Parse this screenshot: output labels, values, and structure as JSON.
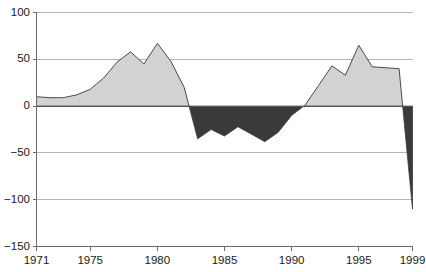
{
  "chart_data": {
    "type": "area",
    "title": "",
    "xlabel": "",
    "ylabel": "",
    "xlim": [
      1971,
      1999
    ],
    "ylim": [
      -150,
      100
    ],
    "grid": true,
    "legend": "none",
    "y_ticks": [
      100,
      50,
      0,
      -50,
      -100,
      -150
    ],
    "y_tick_labels": [
      "100",
      "50",
      "0",
      "−50",
      "−100",
      "−150"
    ],
    "x_ticks": [
      1971,
      1975,
      1980,
      1985,
      1990,
      1995,
      1999
    ],
    "x_tick_labels": [
      "1971",
      "1975",
      "1980",
      "1985",
      "1990",
      "1995",
      "1999"
    ],
    "positive_fill": "#d2d2d2",
    "negative_fill": "#3a3a3a",
    "line_color": "#4a4a4a",
    "grid_color": "#b4b4b4",
    "axis_color": "#6b6b6b",
    "zero_line_color": "#555555",
    "x": [
      1971,
      1972,
      1973,
      1974,
      1975,
      1976,
      1977,
      1978,
      1979,
      1980,
      1981,
      1982,
      1983,
      1984,
      1985,
      1986,
      1987,
      1988,
      1989,
      1990,
      1991,
      1992,
      1993,
      1994,
      1995,
      1996,
      1997,
      1998,
      1999
    ],
    "values": [
      10,
      9,
      9,
      12,
      18,
      30,
      47,
      58,
      45,
      67,
      48,
      20,
      -35,
      -25,
      -32,
      -22,
      -30,
      -38,
      -28,
      -10,
      1,
      22,
      43,
      33,
      65,
      42,
      41,
      40,
      -110
    ]
  }
}
